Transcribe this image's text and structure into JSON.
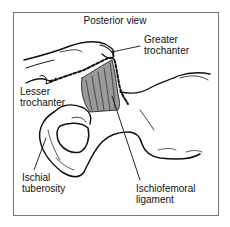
{
  "diagram": {
    "title": "Posterior view",
    "labels": {
      "greater_trochanter": "Greater\ntrochanter",
      "lesser_trochanter": "Lesser\ntrochanter",
      "ischial_tuberosity": "Ischial\ntuberosity",
      "ischiofemoral_ligament": "Ischiofemoral\nligament"
    },
    "colors": {
      "line": "#111111",
      "ligament_fill": "#9a9a9a",
      "frame_border": "#777777",
      "background": "#ffffff"
    }
  }
}
